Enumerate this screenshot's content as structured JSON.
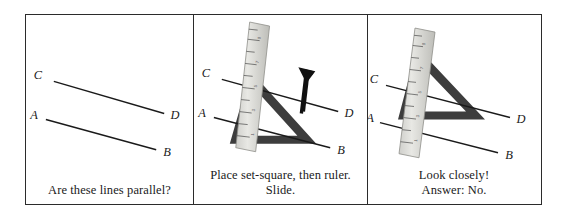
{
  "figure": {
    "title_alt": "Testing whether two lines are parallel with a set-square and ruler",
    "border_color": "#2b2b2b",
    "line_color": "#1a1a1a",
    "setsquare_color": "#3a3a3a",
    "ruler_color": "#d9d9d6",
    "background": "#ffffff"
  },
  "panels": [
    {
      "id": "panel-1",
      "caption_lines": [
        "Are these lines parallel?"
      ],
      "labels": {
        "a": "A",
        "b": "B",
        "c": "C",
        "d": "D"
      },
      "has_ruler": false,
      "has_setsquare": false,
      "has_arrow": false
    },
    {
      "id": "panel-2",
      "caption_lines": [
        "Place set-square, then ruler.",
        "Slide."
      ],
      "labels": {
        "a": "A",
        "b": "B",
        "c": "C",
        "d": "D"
      },
      "has_ruler": true,
      "has_setsquare": true,
      "has_arrow": true,
      "arrow_direction": "up"
    },
    {
      "id": "panel-3",
      "caption_lines": [
        "Look closely!",
        "Answer: No."
      ],
      "labels": {
        "a": "A",
        "b": "B",
        "c": "C",
        "d": "D"
      },
      "has_ruler": true,
      "has_setsquare": true,
      "has_arrow": false
    }
  ],
  "ruler": {
    "tick_numbers": [
      "1",
      "2",
      "3",
      "4",
      "5",
      "6",
      "7",
      "8",
      "9",
      "10"
    ]
  }
}
